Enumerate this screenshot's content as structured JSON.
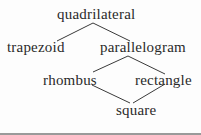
{
  "diagram": {
    "type": "hierarchy",
    "nodes": [
      {
        "id": "quadrilateral",
        "label": "quadrilateral"
      },
      {
        "id": "trapezoid",
        "label": "trapezoid"
      },
      {
        "id": "parallelogram",
        "label": "parallelogram"
      },
      {
        "id": "rhombus",
        "label": "rhombus"
      },
      {
        "id": "rectangle",
        "label": "rectangle"
      },
      {
        "id": "square",
        "label": "square"
      }
    ],
    "edges": [
      {
        "from": "quadrilateral",
        "to": "trapezoid"
      },
      {
        "from": "quadrilateral",
        "to": "parallelogram"
      },
      {
        "from": "parallelogram",
        "to": "rhombus"
      },
      {
        "from": "parallelogram",
        "to": "rectangle"
      },
      {
        "from": "rhombus",
        "to": "square"
      },
      {
        "from": "rectangle",
        "to": "square"
      }
    ]
  }
}
